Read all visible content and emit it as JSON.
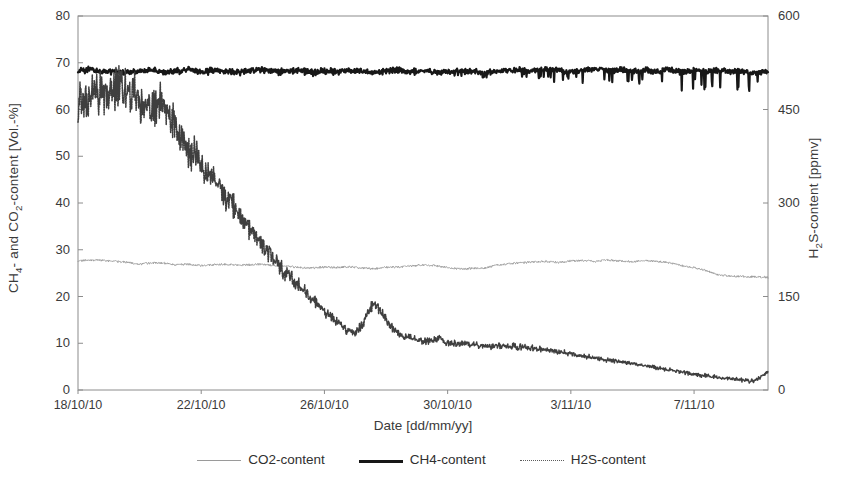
{
  "figure": {
    "plot_box": {
      "x": 78,
      "y": 16,
      "width": 690,
      "height": 374
    }
  },
  "axes": {
    "left": {
      "title": "CH4- and CO2-content [Vol.-%]",
      "title_html": "CH<sub>4</sub>- and CO<sub>2</sub>-content [Vol.-%]",
      "ticks": [
        0,
        10,
        20,
        30,
        40,
        50,
        60,
        70,
        80
      ],
      "min": 0,
      "max": 80
    },
    "right": {
      "title": "H2S-content [ppmv]",
      "title_html": "H<sub>2</sub>S-content [ppmv]",
      "ticks": [
        0,
        150,
        300,
        450,
        600
      ],
      "min": 0,
      "max": 600
    },
    "x": {
      "title": "Date [dd/mm/yy]",
      "ticks": [
        "18/10/10",
        "22/10/10",
        "26/10/10",
        "30/10/10",
        "3/11/10",
        "7/11/10"
      ],
      "tick_positions_days": [
        0,
        4,
        8,
        12,
        16,
        20
      ],
      "min_days": 0,
      "max_days": 22.4
    }
  },
  "legend": {
    "position": "bottom-center",
    "items": [
      {
        "label": "CO2-content",
        "style": "thin-solid-gray",
        "color": "#9a9a9a"
      },
      {
        "label": "CH4-content",
        "style": "thick-solid-black",
        "color": "#171717"
      },
      {
        "label": "H2S-content",
        "style": "dotted-dark-gray",
        "color": "#5c5c5c"
      }
    ]
  },
  "colors": {
    "frame": "#8c8c8c",
    "co2": "#9a9a9a",
    "ch4": "#171717",
    "h2s": "#3f3f3f",
    "text": "#3a3a3a",
    "background": "#ffffff"
  },
  "chart_data": {
    "type": "line",
    "title": "",
    "xlabel": "Date [dd/mm/yy]",
    "ylabel": "CH4- and CO2-content [Vol.-%]",
    "y2label": "H2S-content [ppmv]",
    "xlim_days": [
      0,
      22.4
    ],
    "ylim": [
      0,
      80
    ],
    "y2lim": [
      0,
      600
    ],
    "grid": false,
    "x_tick_labels": [
      "18/10/10",
      "22/10/10",
      "26/10/10",
      "30/10/10",
      "3/11/10",
      "7/11/10"
    ],
    "x_tick_days": [
      0,
      4,
      8,
      12,
      16,
      20
    ],
    "series": [
      {
        "name": "CH4-content",
        "axis": "left",
        "unit": "Vol.-%",
        "x_days": [
          0.0,
          0.4,
          0.8,
          1.2,
          1.6,
          2.0,
          2.4,
          2.8,
          3.2,
          3.6,
          4.0,
          4.4,
          4.8,
          5.2,
          5.6,
          6.0,
          6.4,
          6.8,
          7.2,
          7.6,
          8.0,
          8.4,
          8.8,
          9.2,
          9.6,
          10.0,
          10.4,
          10.8,
          11.2,
          11.6,
          12.0,
          12.4,
          12.8,
          13.2,
          13.6,
          14.0,
          14.4,
          14.8,
          15.2,
          15.6,
          16.0,
          16.4,
          16.8,
          17.2,
          17.6,
          18.0,
          18.4,
          18.8,
          19.2,
          19.6,
          20.0,
          20.4,
          20.8,
          21.2,
          21.6,
          22.0,
          22.4
        ],
        "values": [
          68.4,
          68.6,
          68.1,
          68.3,
          67.9,
          68.2,
          68.5,
          68.0,
          68.3,
          68.6,
          68.1,
          68.4,
          68.2,
          68.0,
          68.3,
          68.5,
          68.1,
          68.2,
          68.4,
          68.0,
          68.3,
          68.1,
          68.4,
          68.2,
          67.9,
          68.2,
          68.5,
          68.1,
          68.3,
          68.0,
          68.2,
          68.4,
          68.1,
          67.8,
          68.2,
          68.4,
          68.5,
          68.2,
          68.6,
          68.3,
          68.0,
          68.4,
          68.7,
          68.3,
          68.5,
          68.1,
          68.4,
          68.2,
          68.5,
          68.0,
          68.3,
          68.1,
          68.4,
          68.0,
          68.2,
          67.8,
          68.1
        ],
        "note": "Near-constant ~68 Vol.-% with fine high-frequency noise; downward spikes grow in amplitude after ~30/10/10, reaching dips to ~63-65 Vol.-%."
      },
      {
        "name": "CO2-content",
        "axis": "left",
        "unit": "Vol.-%",
        "x_days": [
          0.0,
          0.4,
          0.8,
          1.2,
          1.6,
          2.0,
          2.4,
          2.8,
          3.2,
          3.6,
          4.0,
          4.4,
          4.8,
          5.2,
          5.6,
          6.0,
          6.4,
          6.8,
          7.2,
          7.6,
          8.0,
          8.4,
          8.8,
          9.2,
          9.6,
          10.0,
          10.4,
          10.8,
          11.2,
          11.6,
          12.0,
          12.4,
          12.8,
          13.2,
          13.6,
          14.0,
          14.4,
          14.8,
          15.2,
          15.6,
          16.0,
          16.4,
          16.8,
          17.2,
          17.6,
          18.0,
          18.4,
          18.8,
          19.2,
          19.6,
          20.0,
          20.4,
          20.8,
          21.2,
          21.6,
          22.0,
          22.4
        ],
        "values": [
          27.6,
          27.8,
          27.7,
          27.5,
          27.3,
          26.9,
          27.2,
          27.1,
          26.8,
          26.9,
          26.6,
          26.8,
          26.9,
          26.7,
          26.8,
          26.9,
          26.6,
          26.4,
          26.2,
          26.1,
          26.3,
          26.2,
          26.4,
          26.1,
          25.9,
          26.2,
          26.3,
          26.5,
          26.8,
          26.6,
          26.2,
          25.9,
          26.0,
          26.1,
          26.7,
          27.0,
          27.2,
          27.4,
          27.5,
          27.3,
          27.6,
          27.7,
          27.5,
          27.8,
          27.6,
          27.4,
          27.7,
          27.5,
          27.2,
          26.6,
          26.2,
          25.5,
          24.6,
          24.4,
          24.3,
          24.2,
          24.1
        ],
        "note": "Slow drift between ~24 and ~28 Vol.-%; dip near 26/10-29/10, broad rise to ~28 around 3/11-6/11, then decline to ~24 at the end."
      },
      {
        "name": "H2S-content",
        "axis": "right",
        "unit": "ppmv",
        "x_days": [
          0.0,
          0.3,
          0.6,
          0.9,
          1.2,
          1.5,
          1.8,
          2.1,
          2.4,
          2.7,
          3.0,
          3.3,
          3.6,
          3.9,
          4.2,
          4.5,
          4.8,
          5.1,
          5.4,
          5.7,
          6.0,
          6.3,
          6.6,
          6.9,
          7.2,
          7.5,
          7.8,
          8.1,
          8.4,
          8.7,
          9.0,
          9.3,
          9.6,
          9.9,
          10.2,
          10.5,
          10.8,
          11.1,
          11.4,
          11.7,
          12.0,
          12.5,
          13.0,
          13.5,
          14.0,
          14.5,
          15.0,
          15.5,
          16.0,
          16.5,
          17.0,
          17.5,
          18.0,
          18.5,
          19.0,
          19.5,
          20.0,
          20.5,
          21.0,
          21.5,
          22.0,
          22.4
        ],
        "values": [
          455,
          470,
          478,
          472,
          480,
          486,
          474,
          455,
          448,
          462,
          440,
          410,
          385,
          372,
          350,
          330,
          310,
          292,
          270,
          250,
          232,
          215,
          198,
          180,
          168,
          150,
          136,
          122,
          110,
          96,
          92,
          110,
          140,
          120,
          100,
          88,
          84,
          80,
          78,
          82,
          76,
          74,
          72,
          70,
          70,
          68,
          66,
          62,
          58,
          54,
          50,
          46,
          42,
          38,
          34,
          30,
          26,
          22,
          20,
          16,
          14,
          30
        ],
        "note": "Starts ~470 ppmv with noisy plateau to ~20/10, then steep near-linear decline to ~90 ppmv by 26/10 with a local spike to ~140 ppmv around 26/10, then a slow decay from ~85 ppmv to ~15 ppmv by 9/11 with a small upturn to ~30 ppmv at the very end."
      }
    ]
  }
}
